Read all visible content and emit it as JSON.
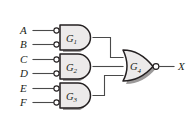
{
  "diagram": {
    "type": "combinational-logic-circuit",
    "background_color": "#ffffff",
    "gate_fill_color": "#eceaea",
    "gate_stroke_color": "#231f20",
    "wire_color": "#4a4a4a"
  },
  "inputs": [
    {
      "label": "A",
      "connects_to": "G1",
      "inverted": true
    },
    {
      "label": "B",
      "connects_to": "G1",
      "inverted": true
    },
    {
      "label": "C",
      "connects_to": "G2",
      "inverted": true
    },
    {
      "label": "D",
      "connects_to": "G2",
      "inverted": true
    },
    {
      "label": "E",
      "connects_to": "G3",
      "inverted": true
    },
    {
      "label": "F",
      "connects_to": "G3",
      "inverted": true
    }
  ],
  "gates": [
    {
      "id": "G1",
      "name": "G",
      "subscript": "1",
      "shape": "and",
      "inverted_inputs": true,
      "inverted_output": false,
      "inputs": [
        "A",
        "B"
      ]
    },
    {
      "id": "G2",
      "name": "G",
      "subscript": "2",
      "shape": "and",
      "inverted_inputs": true,
      "inverted_output": false,
      "inputs": [
        "C",
        "D"
      ]
    },
    {
      "id": "G3",
      "name": "G",
      "subscript": "3",
      "shape": "and",
      "inverted_inputs": true,
      "inverted_output": false,
      "inputs": [
        "E",
        "F"
      ]
    },
    {
      "id": "G4",
      "name": "G",
      "subscript": "4",
      "shape": "or",
      "inverted_inputs": false,
      "inverted_output": true,
      "inputs": [
        "G1",
        "G2",
        "G3"
      ]
    }
  ],
  "outputs": [
    {
      "label": "X",
      "from": "G4"
    }
  ]
}
